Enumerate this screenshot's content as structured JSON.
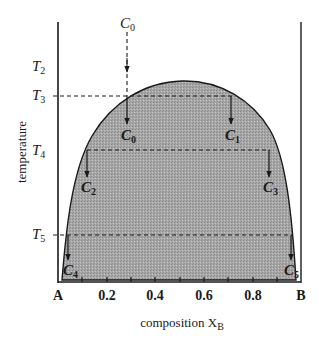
{
  "figure": {
    "type": "phase-diagram"
  },
  "axes": {
    "x_title": "composition X",
    "x_title_sub": "B",
    "y_title": "temperature",
    "x_ticks": [
      {
        "label": "A",
        "value": 0.0
      },
      {
        "label": "0.2",
        "value": 0.2
      },
      {
        "label": "0.4",
        "value": 0.4
      },
      {
        "label": "0.6",
        "value": 0.6
      },
      {
        "label": "0.8",
        "value": 0.8
      },
      {
        "label": "B",
        "value": 1.0
      }
    ],
    "minor_tick_step": 0.1
  },
  "temperatures": [
    {
      "id": "T2",
      "main": "T",
      "sub": "2"
    },
    {
      "id": "T3",
      "main": "T",
      "sub": "3"
    },
    {
      "id": "T4",
      "main": "T",
      "sub": "4"
    },
    {
      "id": "T5",
      "main": "T",
      "sub": "5"
    }
  ],
  "compositions": {
    "top": {
      "main": "C",
      "sub": "0"
    },
    "points": [
      {
        "id": "C0",
        "main": "C",
        "sub": "0",
        "x": 0.28,
        "temperature": "T3"
      },
      {
        "id": "C1",
        "main": "C",
        "sub": "1",
        "x": 0.72,
        "temperature": "T3"
      },
      {
        "id": "C2",
        "main": "C",
        "sub": "2",
        "x": 0.12,
        "temperature": "T4"
      },
      {
        "id": "C3",
        "main": "C",
        "sub": "3",
        "x": 0.87,
        "temperature": "T4"
      },
      {
        "id": "C4",
        "main": "C",
        "sub": "4",
        "x": 0.04,
        "temperature": "T5"
      },
      {
        "id": "C5",
        "main": "C",
        "sub": "5",
        "x": 0.95,
        "temperature": "T5"
      }
    ]
  },
  "colors": {
    "region_fill": "#a9a9a9",
    "line": "#1a1a1a",
    "background": "#ffffff"
  }
}
